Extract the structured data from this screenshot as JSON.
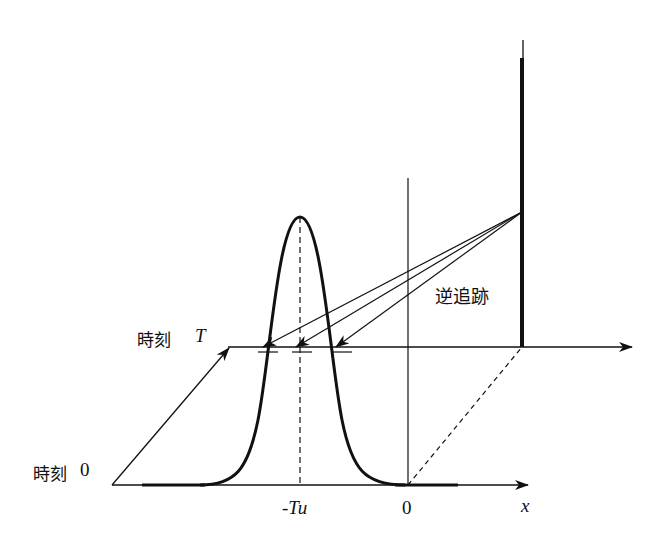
{
  "figure": {
    "labels": {
      "time_T_prefix": "時刻",
      "time_T_symbol": "T",
      "time_0_prefix": "時刻",
      "time_0_symbol": "0",
      "backtrace": "逆追跡",
      "peak_position": "-Tu",
      "origin": "0",
      "x_axis": "x"
    }
  }
}
